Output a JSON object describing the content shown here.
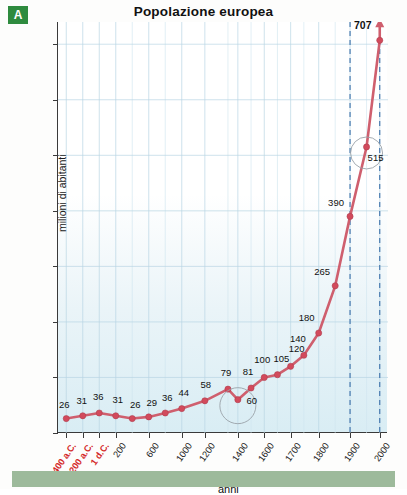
{
  "badge": {
    "label": "A"
  },
  "axis_title_y": "milioni di abitanti",
  "axis_title_x": "anni",
  "chart_data": {
    "type": "line",
    "title": "Popolazione europea",
    "xlabel": "anni",
    "ylabel": "milioni di abitanti",
    "ylim": [
      0,
      740
    ],
    "yticks": [
      0,
      100,
      200,
      300,
      400,
      500,
      600,
      700
    ],
    "grid": true,
    "legend": "none",
    "xtick_labels": [
      "400 a.C.",
      "200 a.C.",
      "1 d.C.",
      "200",
      "600",
      "1000",
      "1200",
      "1400",
      "1600",
      "1700",
      "1800",
      "1900",
      "2000"
    ],
    "categories": [
      "400 a.C.",
      "200 a.C.",
      "1 d.C.",
      "200",
      "400",
      "600",
      "800",
      "1000",
      "1200",
      "1340",
      "1400",
      "1500",
      "1600",
      "1650",
      "1700",
      "1750",
      "1800",
      "1850",
      "1900",
      "1950",
      "2000"
    ],
    "values": [
      26,
      31,
      36,
      31,
      26,
      29,
      36,
      44,
      58,
      79,
      60,
      81,
      100,
      105,
      120,
      140,
      180,
      265,
      390,
      515,
      707
    ],
    "point_labels": [
      "26",
      "31",
      "36",
      "31",
      "26",
      "29",
      "36",
      "44",
      "58",
      "79",
      "60",
      "81",
      "100",
      "105",
      "120",
      "140",
      "180",
      "265",
      "390",
      "515",
      "707"
    ],
    "annotations": [
      {
        "text": "60",
        "note": "circled dip after the 1340 peak (Black Death)"
      },
      {
        "text": "515",
        "note": "circled value at 1950"
      },
      {
        "text": "707",
        "note": "bold end value at 2000, arrow continues upward"
      }
    ],
    "reference_lines": [
      {
        "label": "1900",
        "style": "dashed",
        "color": "#3a6fa8"
      },
      {
        "label": "2000",
        "style": "dashed",
        "color": "#3a6fa8"
      }
    ],
    "series_color": "#cf5f6e",
    "marker_color": "#d24a5c"
  }
}
